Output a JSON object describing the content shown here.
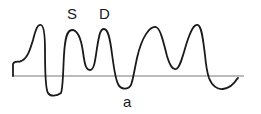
{
  "diagram": {
    "type": "waveform",
    "labels": {
      "s_wave": "S",
      "d_wave": "D",
      "a_wave": "a"
    },
    "colors": {
      "waveform": "#1a1a1a",
      "baseline": "#777777",
      "background": "#ffffff"
    }
  }
}
